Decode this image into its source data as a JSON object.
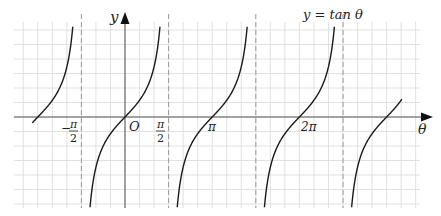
{
  "chart_data": {
    "type": "line",
    "title": "y = tan θ",
    "xlabel": "θ",
    "ylabel": "y",
    "origin_label": "O",
    "x_tick_labels": [
      {
        "label_num": "π",
        "label_den": "2",
        "sign": "−",
        "value": -1.5708
      },
      {
        "label_num": "π",
        "label_den": "2",
        "sign": "",
        "value": 1.5708
      },
      {
        "label": "π",
        "value": 3.1416
      },
      {
        "label": "2π",
        "value": 6.2832
      }
    ],
    "asymptotes": [
      -1.5708,
      1.5708,
      4.7124,
      7.854
    ],
    "function": "tan",
    "xlim": [
      -4.0,
      10.5
    ],
    "ylim": [
      -3.3,
      3.3
    ],
    "grid": true,
    "grid_step_x": "π/6",
    "series": [
      {
        "name": "branch centered at -π",
        "x_center": -3.1416
      },
      {
        "name": "branch centered at 0",
        "x_center": 0
      },
      {
        "name": "branch centered at π",
        "x_center": 3.1416
      },
      {
        "name": "branch centered at 2π",
        "x_center": 6.2832
      },
      {
        "name": "branch centered at 3π",
        "x_center": 9.4248
      }
    ],
    "sample_points": [
      {
        "x": -1.2,
        "y": -2.57
      },
      {
        "x": -0.6,
        "y": -0.68
      },
      {
        "x": 0,
        "y": 0
      },
      {
        "x": 0.6,
        "y": 0.68
      },
      {
        "x": 1.2,
        "y": 2.57
      }
    ]
  },
  "labels": {
    "title": "y = tan θ",
    "y_axis": "y",
    "x_axis": "θ",
    "origin": "O",
    "neg_half_pi_sign": "−",
    "pi_sym": "π",
    "two": "2",
    "pi": "π",
    "two_pi": "2π"
  },
  "colors": {
    "grid": "#d9d9d9",
    "axis": "#555555",
    "curve": "#1a1a1a",
    "asymptote": "#999999"
  }
}
